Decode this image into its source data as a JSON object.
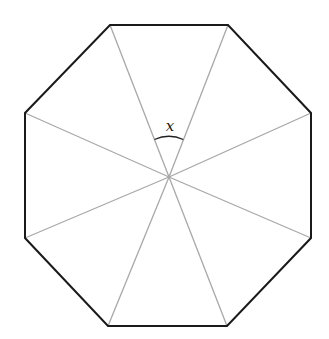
{
  "diagram": {
    "shape": "regular-octagon",
    "vertices": [
      [
        110,
        25
      ],
      [
        228,
        25
      ],
      [
        311,
        113
      ],
      [
        311,
        238
      ],
      [
        227,
        326
      ],
      [
        108,
        326
      ],
      [
        25,
        238
      ],
      [
        25,
        113
      ]
    ],
    "center": [
      169,
      177
    ],
    "angle_label": "x",
    "label_position": [
      171,
      131
    ],
    "colors": {
      "outline": "#1a1a1a",
      "spokes": "#a8a8a8",
      "background": "#ffffff"
    }
  }
}
